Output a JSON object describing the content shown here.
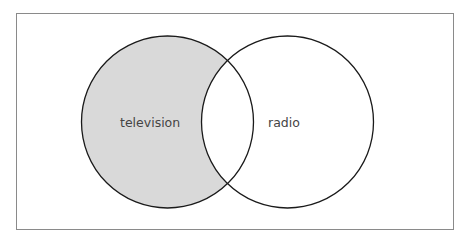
{
  "diagram": {
    "type": "venn",
    "sets": [
      {
        "id": "left",
        "label": "television",
        "fill": "#d9d9d9",
        "shaded": true
      },
      {
        "id": "right",
        "label": "radio",
        "fill": "#ffffff",
        "shaded": false
      }
    ],
    "intersection": {
      "fill": "#ffffff",
      "shaded": false
    },
    "colors": {
      "stroke": "#1a1a1a",
      "frame": "#8a8a8a",
      "text": "#444444"
    }
  }
}
